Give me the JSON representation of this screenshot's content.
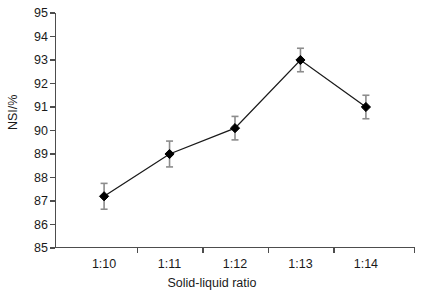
{
  "chart_data": {
    "type": "line",
    "title": "",
    "xlabel": "Solid-liquid ratio",
    "ylabel": "NSI/%",
    "categories": [
      "1:10",
      "1:11",
      "1:12",
      "1:13",
      "1:14"
    ],
    "values": [
      87.2,
      89.0,
      90.1,
      93.0,
      91.0
    ],
    "errors": [
      0.55,
      0.55,
      0.5,
      0.5,
      0.5
    ],
    "ylim": [
      85,
      95
    ],
    "yticks": [
      85,
      86,
      87,
      88,
      89,
      90,
      91,
      92,
      93,
      94,
      95
    ],
    "ytick_labels": [
      "85",
      "86",
      "87",
      "88",
      "89",
      "90",
      "91",
      "92",
      "93",
      "94",
      "95"
    ],
    "grid": false,
    "legend": false,
    "marker": "diamond",
    "marker_color": "#000000",
    "line_color": "#1a1a1a",
    "errorbar_color": "#8c8c8c",
    "background": "#ffffff"
  },
  "axes": {
    "y_title": "NSI/%",
    "x_title": "Solid-liquid ratio"
  }
}
